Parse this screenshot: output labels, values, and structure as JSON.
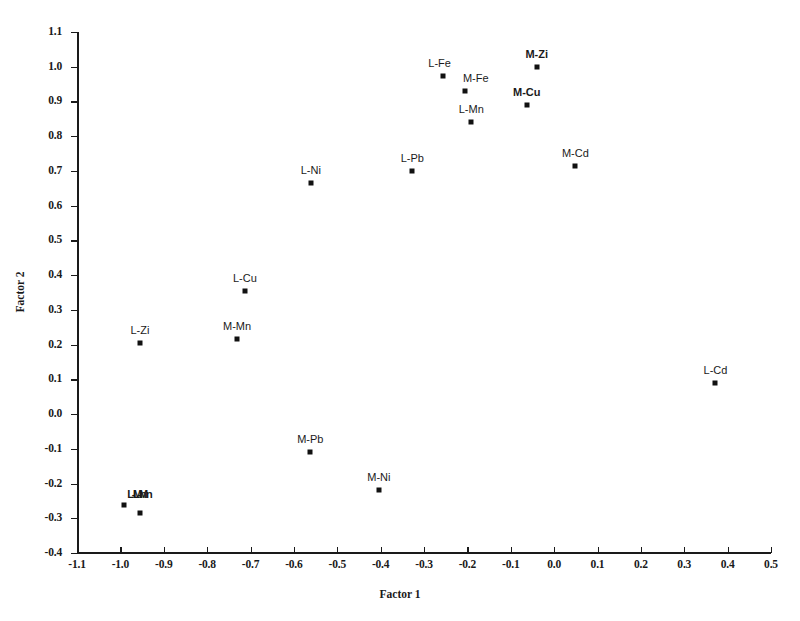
{
  "chart_data": {
    "type": "scatter",
    "title": "",
    "xlabel": "Factor 1",
    "ylabel": "Factor 2",
    "xlim": [
      -1.1,
      0.5
    ],
    "ylim": [
      -0.4,
      1.1
    ],
    "xticks": [
      "-1.1",
      "-1.0",
      "-0.9",
      "-0.8",
      "-0.7",
      "-0.6",
      "-0.5",
      "-0.4",
      "-0.3",
      "-0.2",
      "-0.1",
      "0.0",
      "0.1",
      "0.2",
      "0.3",
      "0.4",
      "0.5"
    ],
    "xtick_values": [
      -1.1,
      -1.0,
      -0.9,
      -0.8,
      -0.7,
      -0.6,
      -0.5,
      -0.4,
      -0.3,
      -0.2,
      -0.1,
      0.0,
      0.1,
      0.2,
      0.3,
      0.4,
      0.5
    ],
    "yticks": [
      "1.1",
      "1.0",
      "0.9",
      "0.8",
      "0.7",
      "0.6",
      "0.5",
      "0.4",
      "0.3",
      "0.2",
      "0.1",
      "0.0",
      "-0.1",
      "-0.2",
      "-0.3",
      "-0.4"
    ],
    "ytick_values": [
      1.1,
      1.0,
      0.9,
      0.8,
      0.7,
      0.6,
      0.5,
      0.4,
      0.3,
      0.2,
      0.1,
      0.0,
      -0.1,
      -0.2,
      -0.3,
      -0.4
    ],
    "grid": false,
    "legend": false,
    "marker_color": "#111111",
    "axis_color": "#1a1a1a",
    "points": [
      {
        "label": "M-Zi",
        "x": -0.04,
        "y": 1.0,
        "bold": true,
        "label_dx": 0,
        "label_dy": -7
      },
      {
        "label": "L-Fe",
        "x": -0.257,
        "y": 0.973,
        "bold": false,
        "label_dx": -3,
        "label_dy": -7
      },
      {
        "label": "M-Fe",
        "x": -0.206,
        "y": 0.93,
        "bold": false,
        "label_dx": 11,
        "label_dy": -7
      },
      {
        "label": "M-Cu",
        "x": -0.063,
        "y": 0.89,
        "bold": true,
        "label_dx": 0,
        "label_dy": -7
      },
      {
        "label": "L-Mn",
        "x": -0.191,
        "y": 0.84,
        "bold": false,
        "label_dx": 0,
        "label_dy": -7
      },
      {
        "label": "M-Cd",
        "x": 0.049,
        "y": 0.715,
        "bold": false,
        "label_dx": 0,
        "label_dy": -7
      },
      {
        "label": "L-Pb",
        "x": -0.327,
        "y": 0.7,
        "bold": false,
        "label_dx": 0,
        "label_dy": -7
      },
      {
        "label": "L-Ni",
        "x": -0.561,
        "y": 0.665,
        "bold": false,
        "label_dx": 0,
        "label_dy": -7
      },
      {
        "label": "L-Cu",
        "x": -0.713,
        "y": 0.355,
        "bold": false,
        "label_dx": 0,
        "label_dy": -7
      },
      {
        "label": "M-Mn",
        "x": -0.731,
        "y": 0.215,
        "bold": false,
        "label_dx": 0,
        "label_dy": -7
      },
      {
        "label": "L-Zi",
        "x": -0.955,
        "y": 0.205,
        "bold": false,
        "label_dx": 0,
        "label_dy": -7
      },
      {
        "label": "L-Cd",
        "x": 0.372,
        "y": 0.09,
        "bold": false,
        "label_dx": 0,
        "label_dy": -7
      },
      {
        "label": "M-Pb",
        "x": -0.562,
        "y": -0.11,
        "bold": false,
        "label_dx": 0,
        "label_dy": -7
      },
      {
        "label": "M-Ni",
        "x": -0.404,
        "y": -0.22,
        "bold": false,
        "label_dx": 0,
        "label_dy": -7
      }
    ],
    "cluster": {
      "note": "overlapping stacked labels, illegible",
      "label": "L-Mn",
      "points": [
        {
          "x": -0.992,
          "y": -0.262
        },
        {
          "x": -0.955,
          "y": -0.285
        }
      ]
    }
  }
}
